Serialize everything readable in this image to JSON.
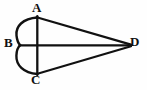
{
  "figure": {
    "background_color": "#fefefe",
    "stroke_color": "#111111",
    "labels": {
      "a": "A",
      "b": "B",
      "c": "C",
      "d": "D"
    },
    "points": {
      "A": {
        "x": 37,
        "y": 17
      },
      "B": {
        "x": 20,
        "y": 45
      },
      "C": {
        "x": 37,
        "y": 74
      },
      "D": {
        "x": 131,
        "y": 45
      }
    },
    "strokes": [
      {
        "name": "vertical-chord-AC",
        "kind": "line",
        "from": "A",
        "to": "C"
      },
      {
        "name": "upper-arc-A-to-B",
        "kind": "arc",
        "from": "A",
        "to": "B",
        "bulge": "left"
      },
      {
        "name": "lower-arc-B-to-C",
        "kind": "arc",
        "from": "B",
        "to": "C",
        "bulge": "left"
      },
      {
        "name": "edge-A-to-D",
        "kind": "line",
        "from": "A",
        "to": "D"
      },
      {
        "name": "axis-B-to-D",
        "kind": "line",
        "from": "B",
        "to": "D"
      },
      {
        "name": "edge-C-to-D",
        "kind": "line",
        "from": "C",
        "to": "D"
      }
    ]
  }
}
